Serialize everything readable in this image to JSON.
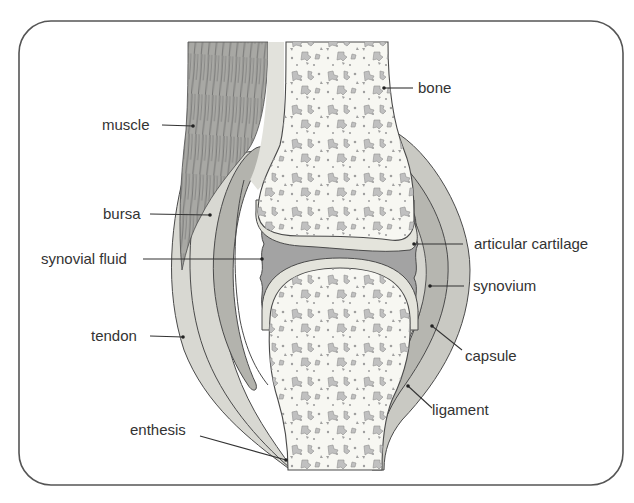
{
  "diagram": {
    "colors": {
      "frame": "#555555",
      "outline": "#4a4a4a",
      "bone_fill": "#f7f7f2",
      "trabecula": "#b9b9b9",
      "cartilage": "#e4e4dc",
      "synovial_fluid": "#a3a3a3",
      "synovium": "#d0d0ca",
      "capsule": "#bdbdb7",
      "ligament": "#c7c7c1",
      "tendon": "#d9d9d3",
      "bursa": "#b3b3ad",
      "muscle": "#a9a9a5",
      "muscle_fiber": "#5a5a5a",
      "leader": "#333333",
      "text": "#333333"
    },
    "labels": {
      "muscle": "muscle",
      "bursa": "bursa",
      "synovial_fluid": "synovial fluid",
      "tendon": "tendon",
      "enthesis": "enthesis",
      "bone": "bone",
      "articular_cartilage": "articular cartilage",
      "synovium": "synovium",
      "capsule": "capsule",
      "ligament": "ligament"
    }
  }
}
